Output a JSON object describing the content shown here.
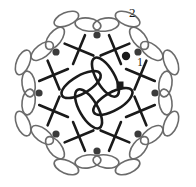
{
  "diagram": {
    "type": "crochet-stitch-diagram",
    "background_color": "#ffffff",
    "ink_color": "#1a1a1a",
    "chain_color": "#6b6b6b",
    "node_color": "#3b3b3b",
    "canvas": {
      "width": 196,
      "height": 187
    },
    "center": {
      "x": 97,
      "y": 93
    },
    "labels": [
      {
        "id": "round-2",
        "text": "2",
        "x": 129,
        "y": 6
      },
      {
        "id": "round-1",
        "text": "1",
        "x": 137,
        "y": 56
      }
    ],
    "marker_dot": {
      "x": 126,
      "y": 56,
      "r": 4.2,
      "color": "#1a1a1a"
    },
    "center_hub": {
      "x": 120,
      "y": 85,
      "size": 7,
      "color": "#1a1a1a"
    },
    "center_petals": {
      "count": 4,
      "rx": 9,
      "ry": 22,
      "orbit_radius": 18,
      "stroke": "#1a1a1a",
      "stroke_width": 2.6,
      "angles": [
        28,
        118,
        208,
        298
      ],
      "offset_angles": [
        60,
        150,
        240,
        330
      ]
    },
    "cross_stitches": {
      "count": 8,
      "radius": 47,
      "arm": 11,
      "stroke": "#1a1a1a",
      "stroke_width": 2.6,
      "angles": [
        22.5,
        67.5,
        112.5,
        157.5,
        202.5,
        247.5,
        292.5,
        337.5
      ]
    },
    "inner_nodes": {
      "count": 8,
      "radius": 58,
      "r": 3.6,
      "color": "#3b3b3b",
      "angles": [
        0,
        45,
        90,
        135,
        180,
        225,
        270,
        315
      ]
    },
    "outer_nodes": {
      "count": 8,
      "radius": 58,
      "label": "chain-junction"
    },
    "chain_arcs": {
      "count": 8,
      "chains_per_arc": 3,
      "bulge": 22,
      "rx": 13,
      "ry": 6.5,
      "stroke": "#6b6b6b",
      "stroke_width": 1.6
    }
  },
  "chart_data": {
    "type": "diagram",
    "rounds": [
      {
        "round": 1,
        "label": "1",
        "symbols": "double crochet (cross) ring",
        "count": 8
      },
      {
        "round": 2,
        "label": "2",
        "symbols": "chain loops (ellipse scallops)",
        "count": 8
      }
    ],
    "center_motif": {
      "petals": 4,
      "symbol": "filled ellipse"
    },
    "legend": []
  }
}
